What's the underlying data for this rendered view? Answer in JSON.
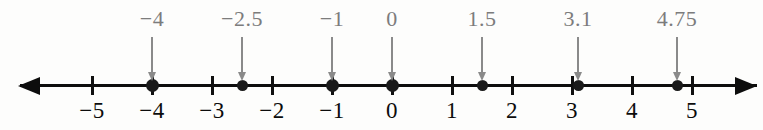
{
  "figure": {
    "axis": {
      "min": -5.8,
      "max": 5.9,
      "origin_x_px": 392,
      "unit_px": 60,
      "left_arrow": "arrow-left",
      "right_arrow": "arrow-right",
      "line_color": "#0d0d0d"
    },
    "ticks": [
      {
        "value": -5,
        "label": "−5"
      },
      {
        "value": -4,
        "label": "−4"
      },
      {
        "value": -3,
        "label": "−3"
      },
      {
        "value": -2,
        "label": "−2"
      },
      {
        "value": -1,
        "label": "−1"
      },
      {
        "value": 0,
        "label": "0"
      },
      {
        "value": 1,
        "label": "1"
      },
      {
        "value": 2,
        "label": "2"
      },
      {
        "value": 3,
        "label": "3"
      },
      {
        "value": 4,
        "label": "4"
      },
      {
        "value": 5,
        "label": "5"
      }
    ],
    "points": [
      {
        "value": -4,
        "label": "−4",
        "on_tick": true
      },
      {
        "value": -2.5,
        "label": "−2.5",
        "on_tick": false
      },
      {
        "value": -1,
        "label": "−1",
        "on_tick": true
      },
      {
        "value": 0,
        "label": "0",
        "on_tick": true
      },
      {
        "value": 1.5,
        "label": "1.5",
        "on_tick": false
      },
      {
        "value": 3.1,
        "label": "3.1",
        "on_tick": false
      },
      {
        "value": 4.75,
        "label": "4.75",
        "on_tick": false
      }
    ],
    "colors": {
      "axis": "#0d0d0d",
      "tick_label": "#0c0c0c",
      "callout_label": "#7c7c7c",
      "callout_arrow": "#8a8a8a",
      "point": "#1a1a1a",
      "background": "#fdfdfc"
    }
  },
  "chart_data": {
    "type": "scatter",
    "title": "",
    "xlabel": "",
    "ylabel": "",
    "xlim": [
      -5.8,
      5.9
    ],
    "grid": false,
    "legend": "none",
    "categories": [
      "−4",
      "−2.5",
      "−1",
      "0",
      "1.5",
      "3.1",
      "4.75"
    ],
    "values": [
      -4,
      -2.5,
      -1,
      0,
      1.5,
      3.1,
      4.75
    ],
    "tick_values": [
      -5,
      -4,
      -3,
      -2,
      -1,
      0,
      1,
      2,
      3,
      4,
      5
    ],
    "tick_labels": [
      "−5",
      "−4",
      "−3",
      "−2",
      "−1",
      "0",
      "1",
      "2",
      "3",
      "4",
      "5"
    ],
    "annotations": [
      {
        "text": "−4",
        "points_to": -4
      },
      {
        "text": "−2.5",
        "points_to": -2.5
      },
      {
        "text": "−1",
        "points_to": -1
      },
      {
        "text": "0",
        "points_to": 0
      },
      {
        "text": "1.5",
        "points_to": 1.5
      },
      {
        "text": "3.1",
        "points_to": 3.1
      },
      {
        "text": "4.75",
        "points_to": 4.75
      }
    ]
  }
}
